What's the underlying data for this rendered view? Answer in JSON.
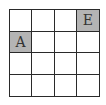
{
  "grid": {
    "rows": 4,
    "cols": 4,
    "shade_color": "#b4b4b4",
    "cells": [
      [
        {
          "label": "",
          "shaded": false
        },
        {
          "label": "",
          "shaded": false
        },
        {
          "label": "",
          "shaded": false
        },
        {
          "label": "E",
          "shaded": true
        }
      ],
      [
        {
          "label": "A",
          "shaded": true
        },
        {
          "label": "",
          "shaded": false
        },
        {
          "label": "",
          "shaded": false
        },
        {
          "label": "",
          "shaded": false
        }
      ],
      [
        {
          "label": "",
          "shaded": false
        },
        {
          "label": "",
          "shaded": false
        },
        {
          "label": "",
          "shaded": false
        },
        {
          "label": "",
          "shaded": false
        }
      ],
      [
        {
          "label": "",
          "shaded": false
        },
        {
          "label": "",
          "shaded": false
        },
        {
          "label": "",
          "shaded": false
        },
        {
          "label": "",
          "shaded": false
        }
      ]
    ]
  }
}
